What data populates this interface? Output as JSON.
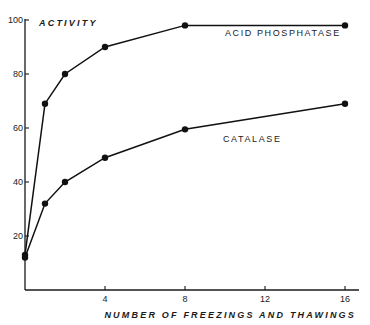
{
  "chart_data": {
    "type": "line",
    "title": "",
    "xlabel": "NUMBER OF FREEZINGS AND THAWINGS",
    "ylabel": "ACTIVITY",
    "xlim": [
      0,
      16
    ],
    "ylim": [
      0,
      100
    ],
    "x_ticks": [
      4,
      8,
      12,
      16
    ],
    "y_ticks": [
      20,
      40,
      60,
      80,
      100
    ],
    "grid": false,
    "legend": "inline labels",
    "series": [
      {
        "name": "ACID PHOSPHATASE",
        "x": [
          0,
          1,
          2,
          4,
          8,
          16
        ],
        "values": [
          13,
          69,
          80,
          90,
          98,
          98
        ],
        "label_pos": {
          "x": 10,
          "y": 94
        }
      },
      {
        "name": "CATALASE",
        "x": [
          0,
          1,
          2,
          4,
          8,
          16
        ],
        "values": [
          12,
          32,
          40,
          49,
          59.5,
          69
        ],
        "label_pos": {
          "x": 9.9,
          "y": 55
        }
      }
    ]
  },
  "colors": {
    "ink": "#111111",
    "background": "#ffffff"
  }
}
